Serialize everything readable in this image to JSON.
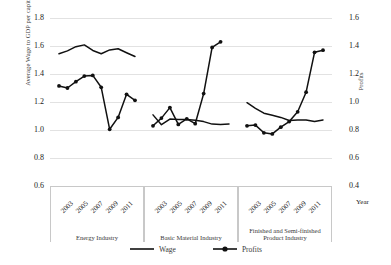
{
  "axes": {
    "left_title": "Average Wage to GDP per capita",
    "right_title": "Profits",
    "x_title": "Year",
    "left_ticks": [
      "1.8",
      "1.6",
      "1.4",
      "1.2",
      "1.0",
      "0.8",
      "0.6"
    ],
    "right_ticks": [
      "1.6",
      "1.4",
      "1.2",
      "1.0",
      "0.8",
      "0.6",
      "0.4"
    ]
  },
  "legend": {
    "items": [
      {
        "label": "Wage",
        "marker": "line",
        "color": "#111111"
      },
      {
        "label": "Profits",
        "marker": "line-diamond",
        "color": "#111111"
      }
    ]
  },
  "panels": [
    {
      "name": "Energy Industry",
      "years": [
        "2003",
        "2005",
        "2007",
        "2009",
        "2011"
      ]
    },
    {
      "name": "Basic Material Industry",
      "years": [
        "2003",
        "2005",
        "2007",
        "2009",
        "2011"
      ]
    },
    {
      "name": "Finished and Semi-finished Product Industry",
      "years": [
        "2003",
        "2005",
        "2007",
        "2009",
        "2011"
      ]
    }
  ],
  "chart_data": {
    "type": "line",
    "title": "",
    "xlabel": "Year",
    "ylabel": "Average Wage to GDP per capita",
    "y2label": "Profits",
    "ylim": [
      0.6,
      1.8
    ],
    "y2lim": [
      0.4,
      1.6
    ],
    "grid": true,
    "legend_position": "bottom-center",
    "panel_layout": "three side-by-side panels sharing the y axes",
    "x": [
      2003,
      2004,
      2005,
      2006,
      2007,
      2008,
      2009,
      2010,
      2011,
      2012
    ],
    "panels": [
      {
        "name": "Energy Industry",
        "series": [
          {
            "name": "Wage",
            "axis": "left",
            "values": [
              1.545,
              1.565,
              1.595,
              1.608,
              1.568,
              1.545,
              1.572,
              1.58,
              1.552,
              1.525
            ]
          },
          {
            "name": "Profits",
            "axis": "right",
            "values": [
              1.115,
              1.1,
              1.145,
              1.185,
              1.19,
              1.105,
              0.805,
              0.89,
              1.055,
              1.012
            ]
          }
        ]
      },
      {
        "name": "Basic Material Industry",
        "series": [
          {
            "name": "Wage",
            "axis": "left",
            "values": [
              1.108,
              1.038,
              1.078,
              1.075,
              1.075,
              1.07,
              1.06,
              1.042,
              1.04,
              1.042
            ]
          },
          {
            "name": "Profits",
            "axis": "right",
            "values": [
              0.83,
              0.885,
              0.96,
              0.84,
              0.88,
              0.845,
              1.06,
              1.39,
              1.43,
              null
            ]
          }
        ]
      },
      {
        "name": "Finished and Semi-finished Product Industry",
        "series": [
          {
            "name": "Wage",
            "axis": "left",
            "values": [
              1.195,
              1.155,
              1.12,
              1.105,
              1.09,
              1.068,
              1.072,
              1.072,
              1.06,
              1.072
            ]
          },
          {
            "name": "Profits",
            "axis": "right",
            "values": [
              0.83,
              0.835,
              0.78,
              0.772,
              0.82,
              0.86,
              0.93,
              1.07,
              1.355,
              1.37
            ]
          }
        ]
      }
    ]
  }
}
